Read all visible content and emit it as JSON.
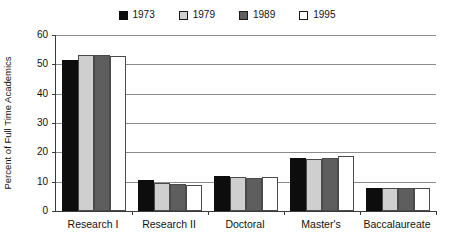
{
  "chart_data": {
    "type": "bar",
    "title": "",
    "subtitle": "",
    "xlabel": "",
    "ylabel": "Percent of Full Time Academics",
    "categories": [
      "Research I",
      "Research II",
      "Doctoral",
      "Master's",
      "Baccalaureate"
    ],
    "series": [
      {
        "name": "1973",
        "color": "#0d0d0d",
        "values": [
          51.5,
          10.5,
          12.1,
          18.0,
          7.8
        ]
      },
      {
        "name": "1979",
        "color": "#cfcfcf",
        "values": [
          53.2,
          9.5,
          11.5,
          17.6,
          7.8
        ]
      },
      {
        "name": "1989",
        "color": "#5e5e5e",
        "values": [
          53.2,
          9.2,
          11.3,
          18.2,
          7.9
        ]
      },
      {
        "name": "1995",
        "color": "#ffffff",
        "values": [
          52.9,
          8.9,
          11.5,
          18.8,
          7.9
        ]
      }
    ],
    "ylim": [
      0,
      60
    ],
    "yticks": [
      0,
      10,
      20,
      30,
      40,
      50,
      60
    ],
    "ytick_labels": [
      "0",
      "10",
      "20",
      "30",
      "40",
      "50",
      "60"
    ],
    "grid": true,
    "grid_axis": "y",
    "legend_position": "top-center"
  },
  "legend": {
    "entries": [
      {
        "label": "1973",
        "swatch": "legend-swatch-1973"
      },
      {
        "label": "1979",
        "swatch": "legend-swatch-1979"
      },
      {
        "label": "1989",
        "swatch": "legend-swatch-1989"
      },
      {
        "label": "1995",
        "swatch": "legend-swatch-1995"
      }
    ]
  }
}
